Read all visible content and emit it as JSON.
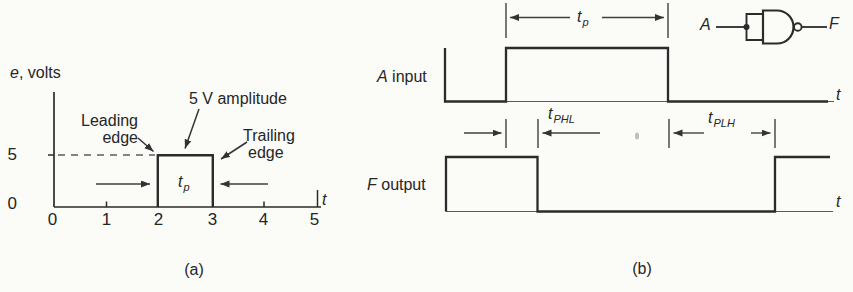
{
  "figure": {
    "panel_a": {
      "caption": "(a)",
      "y_axis_label": {
        "variable": "e",
        "rest": ", volts"
      },
      "y_tick_labels": [
        "5",
        "0"
      ],
      "x_tick_labels": [
        "0",
        "1",
        "2",
        "3",
        "4",
        "5"
      ],
      "x_axis_variable": "t",
      "annotations": {
        "amplitude": "5 V amplitude",
        "leading_edge": {
          "line1": "Leading",
          "line2": "edge"
        },
        "trailing_edge": {
          "line1": "Trailing",
          "line2": "edge"
        }
      },
      "pulse_width_symbol": {
        "base": "t",
        "sub": "p"
      },
      "pulse": {
        "starts_at_t": 2,
        "ends_at_t": 3,
        "amplitude_volts": 5
      }
    },
    "panel_b": {
      "caption": "(b)",
      "input_waveform_label": {
        "variable": "A",
        "rest": " input"
      },
      "output_waveform_label": {
        "variable": "F",
        "rest": " output"
      },
      "time_axis_variable": "t",
      "pulse_width_symbol": {
        "base": "t",
        "sub": "p"
      },
      "propagation_delays": {
        "high_to_low": {
          "base": "t",
          "sub": "PHL"
        },
        "low_to_high": {
          "base": "t",
          "sub": "PLH"
        }
      },
      "gate": {
        "symbol": "nand-gate-tied-inputs",
        "input_label": "A",
        "output_label": "F"
      }
    },
    "colors": {
      "ink": "#2b2b2b",
      "thin_line": "#4f4f4f",
      "paper": "#fbfbf8"
    }
  }
}
